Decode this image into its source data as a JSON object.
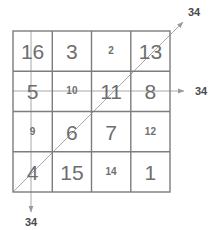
{
  "figure": {
    "title_visible": false,
    "grid": {
      "rows": 4,
      "cols": 4,
      "left": 13,
      "top": 31,
      "right": 170,
      "bottom": 192,
      "border_color": "#808080",
      "cells": [
        [
          {
            "value": "16",
            "size": "big"
          },
          {
            "value": "3",
            "size": "big"
          },
          {
            "value": "2",
            "size": "small"
          },
          {
            "value": "13",
            "size": "big"
          }
        ],
        [
          {
            "value": "5",
            "size": "big"
          },
          {
            "value": "10",
            "size": "small"
          },
          {
            "value": "11",
            "size": "big"
          },
          {
            "value": "8",
            "size": "big"
          }
        ],
        [
          {
            "value": "9",
            "size": "small"
          },
          {
            "value": "6",
            "size": "big"
          },
          {
            "value": "7",
            "size": "big"
          },
          {
            "value": "12",
            "size": "small"
          }
        ],
        [
          {
            "value": "4",
            "size": "big"
          },
          {
            "value": "15",
            "size": "big"
          },
          {
            "value": "14",
            "size": "small"
          },
          {
            "value": "1",
            "size": "big"
          }
        ]
      ]
    },
    "sum_lines": [
      {
        "name": "row-sum-line",
        "orientation": "horizontal",
        "label": "34",
        "label_x": 201,
        "label_y": 91,
        "color": "#9a9a9a"
      },
      {
        "name": "column-sum-line",
        "orientation": "vertical",
        "label": "34",
        "label_x": 31,
        "label_y": 222,
        "color": "#9a9a9a"
      },
      {
        "name": "diagonal-sum-line",
        "orientation": "diagonal",
        "label": "34",
        "label_x": 194,
        "label_y": 12,
        "color": "#9a9a9a"
      }
    ],
    "magic_constant": "34"
  }
}
